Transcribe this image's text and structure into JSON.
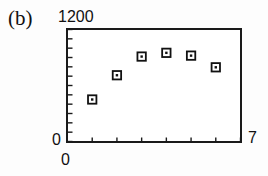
{
  "figure": {
    "panel_label": "(b)",
    "background_color": "#ffffff",
    "axis_color": "#1a1a1a",
    "marker_color": "#111111"
  },
  "labels": {
    "y_max": "1200",
    "y_min": "0",
    "x_min": "0",
    "x_max": "7"
  },
  "chart_data": {
    "type": "scatter",
    "title": "(b)",
    "xlabel": "",
    "ylabel": "",
    "xlim": [
      0,
      7
    ],
    "ylim": [
      0,
      1200
    ],
    "grid": false,
    "legend": null,
    "x_tick_labels": [
      "0",
      "7"
    ],
    "y_tick_labels": [
      "0",
      "1200"
    ],
    "x_minor_ticks": [
      1,
      2,
      3,
      4,
      5,
      6,
      7
    ],
    "y_minor_tick_count": 12,
    "marker": "open-square-with-center-dot",
    "series": [
      {
        "name": "series-1",
        "x": [
          1,
          2,
          3,
          4,
          5,
          6
        ],
        "values": [
          450,
          710,
          910,
          950,
          920,
          795
        ]
      }
    ]
  }
}
